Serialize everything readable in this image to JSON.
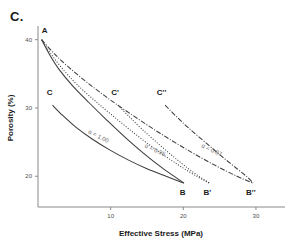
{
  "figure": {
    "panel_label": "C."
  },
  "chart_data": {
    "type": "line",
    "title": "",
    "xlabel": "Effective Stress (MPa)",
    "ylabel": "Porosity (%)",
    "xlim": [
      0,
      34
    ],
    "ylim": [
      15.5,
      42
    ],
    "xticks": [
      10,
      20,
      30
    ],
    "xticklabels": [
      "10",
      "20",
      "30"
    ],
    "yticks": [
      20,
      30,
      40
    ],
    "yticklabels": [
      "20",
      "30",
      "40"
    ],
    "grid": false,
    "legend": "none",
    "series": [
      {
        "name": "A-B",
        "style": "solid",
        "annotation": "α = 1.00",
        "start_point": "A",
        "end_point": "B",
        "x": [
          0.5,
          1.6,
          3.0,
          4.8,
          7.0,
          9.5,
          12.0,
          14.5,
          17.0,
          19.0,
          20.1
        ],
        "y": [
          40.0,
          37.8,
          35.5,
          33.2,
          30.8,
          28.2,
          25.7,
          23.4,
          21.3,
          19.8,
          19.0
        ]
      },
      {
        "name": "A-B'",
        "style": "dotted",
        "annotation": "α = 0.95",
        "start_point": "A",
        "end_point": "B'",
        "x": [
          0.5,
          1.8,
          3.4,
          5.4,
          7.9,
          10.7,
          13.6,
          16.5,
          19.4,
          22.0,
          23.6
        ],
        "y": [
          40.0,
          37.9,
          35.7,
          33.4,
          31.0,
          28.5,
          26.0,
          23.7,
          21.6,
          19.9,
          19.0
        ]
      },
      {
        "name": "A-B''",
        "style": "dashdot",
        "annotation": "α = 0.87",
        "start_point": "A",
        "end_point": "B''",
        "x": [
          0.5,
          2.2,
          4.3,
          6.8,
          9.8,
          13.2,
          16.8,
          20.5,
          24.2,
          27.4,
          29.6
        ],
        "y": [
          40.0,
          38.0,
          35.9,
          33.7,
          31.3,
          28.8,
          26.3,
          23.9,
          21.7,
          20.0,
          19.0
        ]
      },
      {
        "name": "C-B",
        "style": "solid",
        "start_point": "C",
        "end_point": "B",
        "x": [
          2.0,
          3.4,
          5.2,
          7.4,
          9.8,
          12.4,
          15.0,
          17.4,
          19.3,
          20.1
        ],
        "y": [
          30.4,
          28.9,
          27.2,
          25.5,
          23.9,
          22.4,
          21.1,
          20.1,
          19.3,
          19.0
        ]
      },
      {
        "name": "C'-B'",
        "style": "dotted",
        "start_point": "C'",
        "end_point": "B'",
        "x": [
          11.0,
          12.4,
          14.2,
          16.3,
          18.5,
          20.6,
          22.3,
          23.6
        ],
        "y": [
          30.4,
          28.9,
          27.0,
          25.0,
          23.0,
          21.2,
          19.9,
          19.0
        ]
      },
      {
        "name": "C''-B''",
        "style": "dashdot",
        "start_point": "C''",
        "end_point": "B''",
        "x": [
          17.5,
          18.9,
          20.8,
          23.0,
          25.3,
          27.4,
          28.9,
          29.6
        ],
        "y": [
          30.4,
          28.9,
          27.0,
          25.0,
          22.9,
          21.1,
          19.8,
          19.0
        ]
      }
    ],
    "point_labels": [
      {
        "name": "A",
        "text": "A",
        "x": 0.9,
        "y": 41.0
      },
      {
        "name": "C",
        "text": "C",
        "x": 1.6,
        "y": 31.9
      },
      {
        "name": "Cp",
        "text": "C'",
        "x": 10.6,
        "y": 31.9
      },
      {
        "name": "Cpp",
        "text": "C''",
        "x": 17.0,
        "y": 31.9
      },
      {
        "name": "B",
        "text": "B",
        "x": 19.9,
        "y": 17.3
      },
      {
        "name": "Bp",
        "text": "B'",
        "x": 23.3,
        "y": 17.3
      },
      {
        "name": "Bpp",
        "text": "B''",
        "x": 29.3,
        "y": 17.3
      }
    ],
    "annotations": [
      {
        "name": "alpha-1",
        "text": "α = 1.00",
        "x": 8.2,
        "y": 25.6,
        "angle": 27
      },
      {
        "name": "alpha-2",
        "text": "α = 0.95",
        "x": 16.0,
        "y": 23.6,
        "angle": 25
      },
      {
        "name": "alpha-3",
        "text": "α = 0.87",
        "x": 23.8,
        "y": 23.6,
        "angle": 25
      }
    ]
  }
}
